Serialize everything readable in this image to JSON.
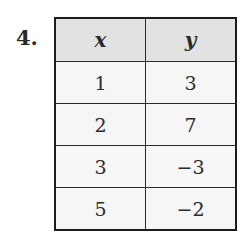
{
  "problem": {
    "number": "4."
  },
  "table": {
    "headers": [
      "x",
      "y"
    ],
    "rows": [
      [
        "1",
        "3"
      ],
      [
        "2",
        "7"
      ],
      [
        "3",
        "−3"
      ],
      [
        "5",
        "−2"
      ]
    ]
  },
  "colors": {
    "header_bg": "#e2e2e2",
    "cell_bg": "#f6f6f6",
    "border": "#1c1c1c",
    "text": "#2b2b2b"
  }
}
